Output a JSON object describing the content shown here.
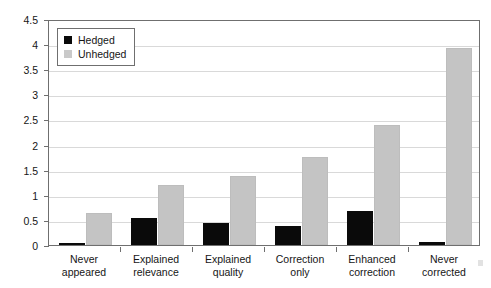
{
  "chart_data": {
    "type": "bar",
    "title": "",
    "xlabel": "",
    "ylabel": "",
    "ylim": [
      0,
      4.5
    ],
    "ytick_step": 0.5,
    "grid": true,
    "legend_position": "top-left",
    "categories": [
      "Never\nappeared",
      "Explained\nrelevance",
      "Explained\nquality",
      "Correction\nonly",
      "Enhanced\ncorrection",
      "Never\ncorrected"
    ],
    "yticks": [
      "0",
      "0.5",
      "1",
      "1.5",
      "2",
      "2.5",
      "3",
      "3.5",
      "4",
      "4.5"
    ],
    "ytick_values": [
      0,
      0.5,
      1,
      1.5,
      2,
      2.5,
      3,
      3.5,
      4,
      4.5
    ],
    "series": [
      {
        "name": "Hedged",
        "color": "#0a0a0a",
        "values": [
          0.04,
          0.53,
          0.44,
          0.38,
          0.68,
          0.07
        ]
      },
      {
        "name": "Unhedged",
        "color": "#c4c4c4",
        "values": [
          0.63,
          1.19,
          1.37,
          1.75,
          2.39,
          3.92
        ]
      }
    ]
  },
  "legend": {
    "items": [
      {
        "label": "Hedged",
        "swatch": "hedged"
      },
      {
        "label": "Unhedged",
        "swatch": "unhedged"
      }
    ]
  },
  "colors": {
    "hedged": "#0a0a0a",
    "unhedged": "#c4c4c4",
    "axis": "#6f6f6f",
    "grid": "#d9d9d9",
    "text": "#161616",
    "background": "#ffffff"
  }
}
